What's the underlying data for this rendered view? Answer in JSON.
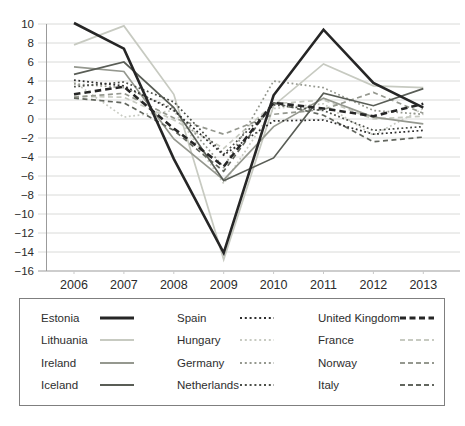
{
  "chart_data": {
    "type": "line",
    "title": "",
    "xlabel": "",
    "ylabel": "",
    "x": [
      2006,
      2007,
      2008,
      2009,
      2010,
      2011,
      2012,
      2013
    ],
    "ylim": [
      -16,
      10
    ],
    "yticks": [
      10,
      8,
      6,
      4,
      2,
      0,
      -2,
      -4,
      -6,
      -8,
      -10,
      -12,
      -14,
      -16
    ],
    "grid": true,
    "legend_position": "bottom",
    "series": [
      {
        "name": "Estonia",
        "style": "solid",
        "thick": true,
        "color": "#262626",
        "values": [
          10.1,
          7.4,
          -4.2,
          -14.1,
          2.5,
          9.4,
          3.8,
          1.2
        ]
      },
      {
        "name": "Lithuania",
        "style": "solid",
        "thick": false,
        "color": "#c7cac1",
        "values": [
          7.8,
          9.8,
          2.6,
          -14.8,
          1.4,
          5.8,
          3.5,
          3.3
        ]
      },
      {
        "name": "Ireland",
        "style": "solid",
        "thick": false,
        "color": "#95988f",
        "values": [
          5.5,
          5.0,
          -2.1,
          -6.4,
          -0.8,
          2.2,
          0.2,
          -0.5
        ]
      },
      {
        "name": "Iceland",
        "style": "solid",
        "thick": false,
        "color": "#595d56",
        "values": [
          4.7,
          6.0,
          1.2,
          -6.5,
          -4.1,
          2.7,
          1.4,
          3.2
        ]
      },
      {
        "name": "Spain",
        "style": "dotted",
        "thick": false,
        "color": "#2e2e2e",
        "values": [
          4.1,
          3.5,
          0.9,
          -3.8,
          -0.2,
          -0.1,
          -1.6,
          -1.2
        ]
      },
      {
        "name": "Hungary",
        "style": "dotted",
        "thick": false,
        "color": "#c7cac1",
        "values": [
          3.9,
          0.2,
          0.9,
          -6.8,
          1.1,
          1.6,
          -1.7,
          1.1
        ]
      },
      {
        "name": "Germany",
        "style": "dotted",
        "thick": false,
        "color": "#95988f",
        "values": [
          3.7,
          3.3,
          1.1,
          -5.1,
          4.0,
          3.3,
          0.9,
          0.5
        ]
      },
      {
        "name": "Netherlands",
        "style": "dotted",
        "thick": false,
        "color": "#4b4e48",
        "values": [
          3.4,
          3.9,
          1.8,
          -3.7,
          1.5,
          0.9,
          -1.2,
          -0.8
        ]
      },
      {
        "name": "United Kingdom",
        "style": "dashed",
        "thick": true,
        "color": "#262626",
        "values": [
          2.6,
          3.4,
          -1.0,
          -5.0,
          1.7,
          1.1,
          0.3,
          1.6
        ]
      },
      {
        "name": "France",
        "style": "dashed",
        "thick": false,
        "color": "#c7cac1",
        "values": [
          2.4,
          2.3,
          -0.1,
          -3.1,
          1.6,
          2.0,
          0.0,
          0.3
        ]
      },
      {
        "name": "Norway",
        "style": "dashed",
        "thick": false,
        "color": "#95988f",
        "values": [
          2.3,
          2.7,
          0.1,
          -1.6,
          0.5,
          1.0,
          2.8,
          0.6
        ]
      },
      {
        "name": "Italy",
        "style": "dashed",
        "thick": false,
        "color": "#62665e",
        "values": [
          2.2,
          1.7,
          -1.2,
          -5.5,
          1.7,
          0.4,
          -2.4,
          -1.9
        ]
      }
    ],
    "colors": {
      "gridline": "#d9dad8",
      "axis": "#9b9b9b",
      "tick_text": "#2b2b2b"
    }
  }
}
